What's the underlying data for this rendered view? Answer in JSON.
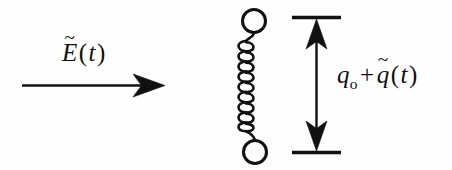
{
  "figure": {
    "title": "Driven harmonic oscillator with applied electric field",
    "background_color": "#fefefe",
    "ink_color": "#111111",
    "width": 452,
    "height": 170
  },
  "efield": {
    "label_full": "E~(t)",
    "symbol": "E",
    "tilde": "~",
    "open_paren": "(",
    "argument": "t",
    "close_paren": ")",
    "arrow_name": "rightward-arrow",
    "arrow_direction": "right"
  },
  "oscillator": {
    "name": "spring-mass-oscillator",
    "top_mass_name": "top-mass-circle",
    "bottom_mass_name": "bottom-mass-circle",
    "spring_name": "spring-coil",
    "coil_turns": 10
  },
  "displacement": {
    "label_full": "q_o + q~(t)",
    "equilibrium_symbol": "q",
    "equilibrium_subscript": "o",
    "plus": "+",
    "fluctuation_symbol": "q",
    "tilde": "~",
    "open_paren": "(",
    "argument": "t",
    "close_paren": ")",
    "arrow_name": "double-headed-vertical-arrow",
    "top_tick_name": "upper-reference-tick",
    "bottom_tick_name": "lower-reference-tick"
  }
}
